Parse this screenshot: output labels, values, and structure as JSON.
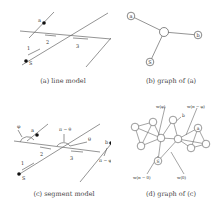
{
  "panels": {
    "a": {
      "caption": "(a) line model",
      "labels": {
        "a": "a",
        "b": "b",
        "S": "S",
        "seg1": "1",
        "seg2": "2",
        "seg3": "3"
      }
    },
    "b": {
      "caption": "(b) graph of (a)",
      "nodes": [
        "a",
        "b",
        "S"
      ]
    },
    "c": {
      "caption": "(c) segment model",
      "labels": {
        "phi": "φ",
        "a": "a",
        "pi_theta": "π − θ",
        "theta": "θ",
        "b": "b",
        "pi_phi": "π − φ",
        "S": "S",
        "seg1": "1",
        "seg2": "2",
        "seg3": "3"
      }
    },
    "d": {
      "caption": "(d) graph of (c)",
      "labels": {
        "w_phi": "w(φ)",
        "w_pi_phi": "w(π − φ)",
        "b": "b",
        "w_pi_theta": "w(π − θ)",
        "w_theta": "w(θ)",
        "a": "a",
        "S": "S"
      }
    }
  },
  "colors": {
    "line": "#555555",
    "node_fill": "#ffffff",
    "dot": "#111111",
    "text": "#333333"
  }
}
